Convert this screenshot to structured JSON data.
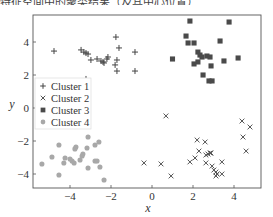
{
  "caption_fragment": "特征空间中的聚类结果（及其中心位置）",
  "chart_data": {
    "type": "scatter",
    "title": "",
    "xlabel": "x",
    "ylabel": "y",
    "xlim": [
      -5.8,
      5.3
    ],
    "ylim": [
      -4.8,
      5.6
    ],
    "xticks": [
      -4,
      -2,
      0,
      2,
      4
    ],
    "yticks": [
      -4,
      -2,
      0,
      2,
      4
    ],
    "grid": false,
    "legend_position": "center left",
    "series": [
      {
        "name": "Cluster 1",
        "marker": "plus",
        "color": "#444444",
        "points": [
          [
            -4.78,
            3.45
          ],
          [
            -3.46,
            3.52
          ],
          [
            -3.32,
            3.39
          ],
          [
            -3.22,
            3.33
          ],
          [
            -3.12,
            3.27
          ],
          [
            -2.98,
            2.91
          ],
          [
            -2.68,
            2.97
          ],
          [
            -2.49,
            2.85
          ],
          [
            -2.39,
            2.79
          ],
          [
            -2.34,
            2.73
          ],
          [
            -2.2,
            2.97
          ],
          [
            -2.15,
            3.09
          ],
          [
            -1.76,
            4.3
          ],
          [
            -1.61,
            3.64
          ],
          [
            -0.83,
            3.39
          ],
          [
            -1.71,
            2.91
          ],
          [
            -1.8,
            2.61
          ],
          [
            -1.71,
            2.24
          ],
          [
            -0.83,
            2.24
          ],
          [
            -3.22,
            1.76
          ]
        ]
      },
      {
        "name": "Cluster 2",
        "marker": "x",
        "color": "#555555",
        "points": [
          [
            0.68,
            -0.48
          ],
          [
            4.39,
            -0.79
          ],
          [
            4.78,
            -1.15
          ],
          [
            4.44,
            -1.76
          ],
          [
            2.2,
            -1.94
          ],
          [
            2.59,
            -2.06
          ],
          [
            4.59,
            -2.61
          ],
          [
            2.29,
            -2.61
          ],
          [
            2.73,
            -2.79
          ],
          [
            2.83,
            -2.73
          ],
          [
            2.63,
            -2.85
          ],
          [
            2.88,
            -2.73
          ],
          [
            2.1,
            -3.03
          ],
          [
            1.85,
            -3.27
          ],
          [
            0.44,
            -3.39
          ],
          [
            2.63,
            -3.33
          ],
          [
            3.41,
            -3.27
          ],
          [
            2.93,
            -3.52
          ],
          [
            3.02,
            -3.76
          ],
          [
            3.12,
            -3.88
          ],
          [
            3.17,
            -4.0
          ],
          [
            3.12,
            -4.12
          ],
          [
            3.41,
            -4.0
          ],
          [
            0.93,
            -4.12
          ],
          [
            -0.39,
            -3.33
          ]
        ]
      },
      {
        "name": "Cluster 3",
        "marker": "square",
        "color": "#4a4a4a",
        "points": [
          [
            1.85,
            5.27
          ],
          [
            3.76,
            5.21
          ],
          [
            1.66,
            4.36
          ],
          [
            1.76,
            3.94
          ],
          [
            2.05,
            3.94
          ],
          [
            3.32,
            4.06
          ],
          [
            2.24,
            3.39
          ],
          [
            2.34,
            3.21
          ],
          [
            2.44,
            3.09
          ],
          [
            2.68,
            3.15
          ],
          [
            2.83,
            3.09
          ],
          [
            2.24,
            2.79
          ],
          [
            1.0,
            2.97
          ],
          [
            2.05,
            2.67
          ],
          [
            3.51,
            2.85
          ],
          [
            4.2,
            3.03
          ],
          [
            2.88,
            2.55
          ],
          [
            2.49,
            2.0
          ],
          [
            2.78,
            1.64
          ],
          [
            2.93,
            1.64
          ]
        ]
      },
      {
        "name": "Cluster 4",
        "marker": "circle",
        "color": "#a8a8a8",
        "points": [
          [
            -3.12,
            -1.76
          ],
          [
            -4.54,
            -2.24
          ],
          [
            -3.71,
            -2.36
          ],
          [
            -3.76,
            -2.48
          ],
          [
            -3.17,
            -2.42
          ],
          [
            -2.78,
            -2.24
          ],
          [
            -2.59,
            -2.06
          ],
          [
            -4.0,
            -3.09
          ],
          [
            -3.9,
            -3.21
          ],
          [
            -3.8,
            -3.33
          ],
          [
            -3.51,
            -3.15
          ],
          [
            -3.41,
            -2.91
          ],
          [
            -3.37,
            -2.79
          ],
          [
            -2.78,
            -3.21
          ],
          [
            -2.68,
            -3.21
          ],
          [
            -2.54,
            -3.58
          ],
          [
            -3.12,
            -3.64
          ],
          [
            -4.54,
            -4.06
          ],
          [
            -2.34,
            -4.36
          ],
          [
            -5.37,
            -3.39
          ],
          [
            -4.88,
            -2.97
          ],
          [
            -4.3,
            -3.33
          ],
          [
            -4.24,
            -3.03
          ]
        ]
      }
    ]
  }
}
